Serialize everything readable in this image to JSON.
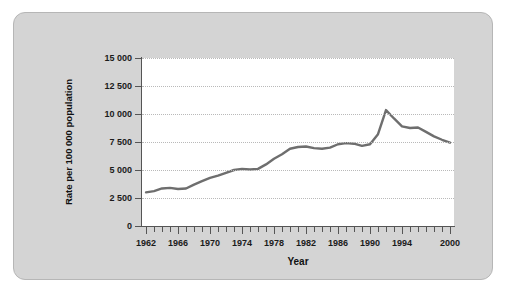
{
  "figure": {
    "panel_background": "#d4d4d4",
    "plot_background": "#ffffff",
    "line_color": "#6e6e6e",
    "grid_color": "#b9b9b9",
    "axis_color": "#555555"
  },
  "chart_data": {
    "type": "line",
    "title": "",
    "xlabel": "Year",
    "ylabel": "Rate per 100 000 population",
    "xlim": [
      1961.5,
      2000.5
    ],
    "ylim": [
      0,
      15000
    ],
    "grid": true,
    "legend": "none",
    "y_ticks": [
      0,
      2500,
      5000,
      7500,
      10000,
      12500,
      15000
    ],
    "y_tick_labels": [
      "0",
      "2 500",
      "5 000",
      "7 500",
      "10 000",
      "12 500",
      "15 000"
    ],
    "x_ticks": [
      1962,
      1963,
      1964,
      1965,
      1966,
      1967,
      1968,
      1969,
      1970,
      1971,
      1972,
      1973,
      1974,
      1975,
      1976,
      1977,
      1978,
      1979,
      1980,
      1981,
      1982,
      1983,
      1984,
      1985,
      1986,
      1987,
      1988,
      1989,
      1990,
      1991,
      1992,
      1993,
      1994,
      1995,
      1996,
      1997,
      1998,
      1999,
      2000
    ],
    "x_tick_labels": [
      "1962",
      "1966",
      "1970",
      "1974",
      "1978",
      "1982",
      "1986",
      "1990",
      "1994",
      "2000"
    ],
    "x_labeled_ticks": [
      1962,
      1966,
      1970,
      1974,
      1978,
      1982,
      1986,
      1990,
      1994,
      2000
    ],
    "series": [
      {
        "name": "Rate per 100 000 population",
        "x": [
          1962,
          1963,
          1964,
          1965,
          1966,
          1967,
          1968,
          1969,
          1970,
          1971,
          1972,
          1973,
          1974,
          1975,
          1976,
          1977,
          1978,
          1979,
          1980,
          1981,
          1982,
          1983,
          1984,
          1985,
          1986,
          1987,
          1988,
          1989,
          1990,
          1991,
          1992,
          1993,
          1994,
          1995,
          1996,
          1997,
          1998,
          1999,
          2000
        ],
        "values": [
          3000,
          3120,
          3350,
          3400,
          3300,
          3350,
          3700,
          4000,
          4300,
          4500,
          4750,
          5000,
          5100,
          5050,
          5100,
          5500,
          6000,
          6400,
          6900,
          7050,
          7100,
          6950,
          6900,
          7000,
          7300,
          7400,
          7350,
          7150,
          7300,
          8200,
          10350,
          9600,
          8900,
          8750,
          8800,
          8400,
          8000,
          7700,
          7450
        ]
      }
    ]
  }
}
